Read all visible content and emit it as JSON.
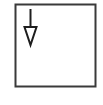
{
  "diagram": {
    "shape": "square-box",
    "icon": "arrow-down-icon",
    "colors": {
      "background": "#ffffff",
      "stroke": "#3a3a3a"
    }
  }
}
